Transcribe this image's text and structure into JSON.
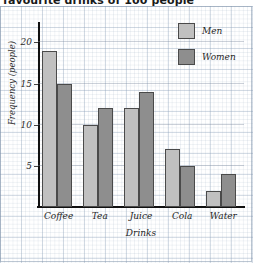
{
  "chart_data": {
    "type": "bar",
    "title": "favourite drinks of 100 people",
    "xlabel": "Drinks",
    "ylabel": "Frequency (people)",
    "categories": [
      "Coffee",
      "Tea",
      "Juice",
      "Cola",
      "Water"
    ],
    "series": [
      {
        "name": "Men",
        "color": "#c0c0c0",
        "values": [
          19,
          10,
          12,
          7,
          2
        ]
      },
      {
        "name": "Women",
        "color": "#8e8e8e",
        "values": [
          15,
          12,
          14,
          5,
          4
        ]
      }
    ],
    "ylim": [
      0,
      22
    ],
    "yticks": [
      5,
      10,
      15,
      20
    ],
    "ytick_labels": [
      "5",
      "10",
      "15",
      "20"
    ],
    "grid": true,
    "legend_position": "top-right",
    "background": "graph-paper"
  }
}
